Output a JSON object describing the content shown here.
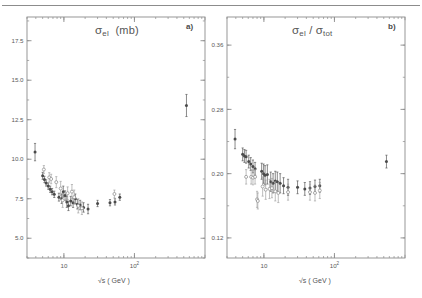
{
  "figure": {
    "background": "#ffffff",
    "ink_color": "#4a4a4a",
    "axis_color": "#8c8c8c",
    "width": 422,
    "height": 298
  },
  "chart_data": [
    {
      "type": "scatter",
      "panel_label": "a)",
      "title": "σ_el (mb)",
      "title_parts": {
        "symbol": "σ",
        "subscript": "el",
        "unit": "(mb)"
      },
      "xlabel": "√s ( GeV )",
      "ylabel": "",
      "xscale": "log",
      "xlim": [
        3.0,
        1000.0
      ],
      "ylim": [
        3.75,
        19.0
      ],
      "yticks": [
        5.0,
        7.5,
        10.0,
        12.5,
        15.0,
        17.5
      ],
      "ytick_labels": [
        "5.0",
        "7.5",
        "10.0",
        "12.5",
        "15.0",
        "17.5"
      ],
      "xticks": [
        10,
        100
      ],
      "xtick_labels": [
        "10",
        "10²"
      ],
      "grid": false,
      "legend": "none",
      "series": [
        {
          "name": "filled",
          "marker": "filled-circle",
          "points": [
            {
              "x": 3.9,
              "y": 10.45,
              "yerr": 0.55
            },
            {
              "x": 5.0,
              "y": 8.95,
              "yerr": 0.22
            },
            {
              "x": 5.3,
              "y": 8.72,
              "yerr": 0.2
            },
            {
              "x": 5.6,
              "y": 8.5,
              "yerr": 0.2
            },
            {
              "x": 6.0,
              "y": 8.3,
              "yerr": 0.2
            },
            {
              "x": 6.4,
              "y": 8.1,
              "yerr": 0.2
            },
            {
              "x": 6.8,
              "y": 7.95,
              "yerr": 0.2
            },
            {
              "x": 7.3,
              "y": 7.78,
              "yerr": 0.2
            },
            {
              "x": 8.5,
              "y": 7.6,
              "yerr": 0.25
            },
            {
              "x": 9.3,
              "y": 7.5,
              "yerr": 0.3
            },
            {
              "x": 9.8,
              "y": 7.95,
              "yerr": 0.35
            },
            {
              "x": 10.4,
              "y": 7.7,
              "yerr": 0.3
            },
            {
              "x": 11.0,
              "y": 7.3,
              "yerr": 0.35
            },
            {
              "x": 11.6,
              "y": 7.05,
              "yerr": 0.3
            },
            {
              "x": 12.5,
              "y": 7.35,
              "yerr": 0.3
            },
            {
              "x": 13.5,
              "y": 7.25,
              "yerr": 0.3
            },
            {
              "x": 14.5,
              "y": 7.5,
              "yerr": 0.3
            },
            {
              "x": 15.5,
              "y": 7.15,
              "yerr": 0.3
            },
            {
              "x": 17.0,
              "y": 7.1,
              "yerr": 0.3
            },
            {
              "x": 19.0,
              "y": 6.95,
              "yerr": 0.3
            },
            {
              "x": 22.0,
              "y": 6.85,
              "yerr": 0.3
            },
            {
              "x": 30.0,
              "y": 7.2,
              "yerr": 0.2
            },
            {
              "x": 45.0,
              "y": 7.25,
              "yerr": 0.2
            },
            {
              "x": 53.0,
              "y": 7.3,
              "yerr": 0.2
            },
            {
              "x": 62.0,
              "y": 7.6,
              "yerr": 0.2
            },
            {
              "x": 546.0,
              "y": 13.4,
              "yerr": 0.7
            }
          ]
        },
        {
          "name": "open",
          "marker": "open-circle",
          "points": [
            {
              "x": 5.2,
              "y": 9.35,
              "yerr": 0.25
            },
            {
              "x": 6.2,
              "y": 8.85,
              "yerr": 0.3
            },
            {
              "x": 6.6,
              "y": 8.75,
              "yerr": 0.3
            },
            {
              "x": 7.8,
              "y": 8.55,
              "yerr": 0.35
            },
            {
              "x": 9.0,
              "y": 8.15,
              "yerr": 0.45
            },
            {
              "x": 9.6,
              "y": 7.4,
              "yerr": 0.45
            },
            {
              "x": 11.3,
              "y": 7.85,
              "yerr": 0.4
            },
            {
              "x": 13.0,
              "y": 7.95,
              "yerr": 0.45
            },
            {
              "x": 14.0,
              "y": 7.6,
              "yerr": 0.45
            },
            {
              "x": 16.0,
              "y": 7.05,
              "yerr": 0.45
            },
            {
              "x": 18.0,
              "y": 6.9,
              "yerr": 0.4
            },
            {
              "x": 52.0,
              "y": 7.8,
              "yerr": 0.25
            }
          ]
        }
      ]
    },
    {
      "type": "scatter",
      "panel_label": "b)",
      "title": "σ_el / σ_tot",
      "title_parts": {
        "numerator_symbol": "σ",
        "numerator_sub": "el",
        "slash": "/",
        "denominator_symbol": "σ",
        "denominator_sub": "tot"
      },
      "xlabel": "√s ( GeV )",
      "ylabel": "",
      "xscale": "log",
      "xlim": [
        3.0,
        1000.0
      ],
      "ylim": [
        0.095,
        0.395
      ],
      "yticks": [
        0.12,
        0.2,
        0.28,
        0.36
      ],
      "ytick_labels": [
        "0.12",
        "0.20",
        "0.28",
        "0.36"
      ],
      "xticks": [
        10,
        100
      ],
      "xtick_labels": [
        "10",
        "10²"
      ],
      "grid": false,
      "legend": "none",
      "series": [
        {
          "name": "filled",
          "marker": "filled-circle",
          "points": [
            {
              "x": 3.9,
              "y": 0.243,
              "yerr": 0.012
            },
            {
              "x": 5.0,
              "y": 0.224,
              "yerr": 0.008
            },
            {
              "x": 5.3,
              "y": 0.222,
              "yerr": 0.008
            },
            {
              "x": 5.6,
              "y": 0.221,
              "yerr": 0.008
            },
            {
              "x": 6.1,
              "y": 0.215,
              "yerr": 0.008
            },
            {
              "x": 6.5,
              "y": 0.212,
              "yerr": 0.008
            },
            {
              "x": 7.0,
              "y": 0.209,
              "yerr": 0.008
            },
            {
              "x": 7.5,
              "y": 0.206,
              "yerr": 0.008
            },
            {
              "x": 9.3,
              "y": 0.203,
              "yerr": 0.01
            },
            {
              "x": 9.9,
              "y": 0.2,
              "yerr": 0.012
            },
            {
              "x": 10.4,
              "y": 0.198,
              "yerr": 0.012
            },
            {
              "x": 11.2,
              "y": 0.199,
              "yerr": 0.012
            },
            {
              "x": 12.5,
              "y": 0.19,
              "yerr": 0.012
            },
            {
              "x": 13.5,
              "y": 0.188,
              "yerr": 0.012
            },
            {
              "x": 14.5,
              "y": 0.191,
              "yerr": 0.012
            },
            {
              "x": 15.5,
              "y": 0.19,
              "yerr": 0.012
            },
            {
              "x": 17.0,
              "y": 0.188,
              "yerr": 0.012
            },
            {
              "x": 19.0,
              "y": 0.185,
              "yerr": 0.01
            },
            {
              "x": 22.0,
              "y": 0.183,
              "yerr": 0.01
            },
            {
              "x": 30.0,
              "y": 0.183,
              "yerr": 0.008
            },
            {
              "x": 38.0,
              "y": 0.181,
              "yerr": 0.008
            },
            {
              "x": 45.0,
              "y": 0.182,
              "yerr": 0.008
            },
            {
              "x": 53.0,
              "y": 0.184,
              "yerr": 0.008
            },
            {
              "x": 62.0,
              "y": 0.185,
              "yerr": 0.008
            },
            {
              "x": 546.0,
              "y": 0.215,
              "yerr": 0.008
            }
          ]
        },
        {
          "name": "open",
          "marker": "open-circle",
          "points": [
            {
              "x": 5.6,
              "y": 0.196,
              "yerr": 0.009
            },
            {
              "x": 6.6,
              "y": 0.196,
              "yerr": 0.009
            },
            {
              "x": 7.0,
              "y": 0.195,
              "yerr": 0.009
            },
            {
              "x": 7.5,
              "y": 0.196,
              "yerr": 0.009
            },
            {
              "x": 8.0,
              "y": 0.168,
              "yerr": 0.01
            },
            {
              "x": 8.2,
              "y": 0.166,
              "yerr": 0.01
            },
            {
              "x": 9.6,
              "y": 0.184,
              "yerr": 0.012
            },
            {
              "x": 10.6,
              "y": 0.18,
              "yerr": 0.012
            },
            {
              "x": 12.0,
              "y": 0.181,
              "yerr": 0.012
            },
            {
              "x": 13.0,
              "y": 0.182,
              "yerr": 0.012
            },
            {
              "x": 14.5,
              "y": 0.178,
              "yerr": 0.012
            },
            {
              "x": 16.0,
              "y": 0.176,
              "yerr": 0.012
            },
            {
              "x": 22.0,
              "y": 0.177,
              "yerr": 0.01
            },
            {
              "x": 45.0,
              "y": 0.177,
              "yerr": 0.01
            },
            {
              "x": 53.0,
              "y": 0.176,
              "yerr": 0.01
            },
            {
              "x": 62.0,
              "y": 0.179,
              "yerr": 0.01
            }
          ]
        }
      ]
    }
  ]
}
